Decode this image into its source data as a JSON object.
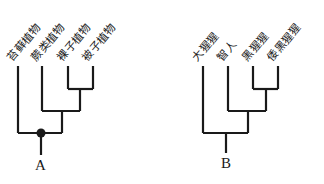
{
  "diagrams": [
    {
      "id": "A",
      "label": "A",
      "leaves": [
        "苔藓植物",
        "蕨类植物",
        "裸子植物",
        "被子植物"
      ],
      "has_root_node_dot": true
    },
    {
      "id": "B",
      "label": "B",
      "leaves": [
        "大猩猩",
        "智人",
        "黑猩猩",
        "倭黑猩猩"
      ],
      "has_root_node_dot": false
    }
  ],
  "colors": {
    "line": "#1a1a1a",
    "background": "#ffffff"
  }
}
